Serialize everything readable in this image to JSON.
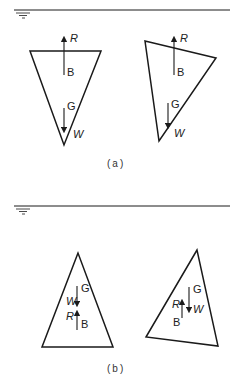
{
  "figure": {
    "panels": [
      {
        "caption": "(a)",
        "water_surface": true,
        "bodies": [
          {
            "name": "upright-inverted-triangle",
            "labels": {
              "buoyancy": "R",
              "center_buoyancy": "B",
              "center_gravity": "G",
              "weight": "W"
            }
          },
          {
            "name": "tilted-inverted-triangle",
            "labels": {
              "buoyancy": "R",
              "center_buoyancy": "B",
              "center_gravity": "G",
              "weight": "W"
            }
          }
        ]
      },
      {
        "caption": "(b)",
        "water_surface": true,
        "bodies": [
          {
            "name": "upright-triangle",
            "labels": {
              "buoyancy": "R",
              "center_buoyancy": "B",
              "center_gravity": "G",
              "weight": "W"
            }
          },
          {
            "name": "tilted-triangle",
            "labels": {
              "buoyancy": "R",
              "center_buoyancy": "B",
              "center_gravity": "G",
              "weight": "W"
            }
          }
        ]
      }
    ]
  }
}
